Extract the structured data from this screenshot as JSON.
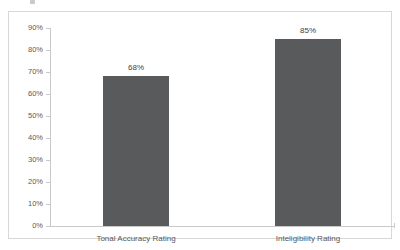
{
  "chart_data": {
    "type": "bar",
    "title": "",
    "subtitle": "",
    "xlabel": "",
    "ylabel": "",
    "categories": [
      "Tonal Accuracy Rating",
      "Inteligibility Rating"
    ],
    "values": [
      68,
      85
    ],
    "data_labels": [
      "68%",
      "85%"
    ],
    "series": [
      {
        "name": "",
        "values": [
          68,
          85
        ],
        "color": "#595a5c"
      }
    ],
    "ylim": [
      0,
      90
    ],
    "y_tick_values": [
      0,
      10,
      20,
      30,
      40,
      50,
      60,
      70,
      80,
      90
    ],
    "y_tick_labels": [
      "0%",
      "10%",
      "20%",
      "30%",
      "40%",
      "50%",
      "60%",
      "70%",
      "80%",
      "90%"
    ],
    "grid": false,
    "legend": false,
    "legend_position": "none",
    "annotations": []
  },
  "style": {
    "bar_color": "#595a5c",
    "axis_color": "#c9c9c9",
    "frame_color": "#d8d8d8",
    "tick_label_color": "#58595b",
    "data_label_color": "#3f3f3f",
    "background": "#ffffff"
  }
}
